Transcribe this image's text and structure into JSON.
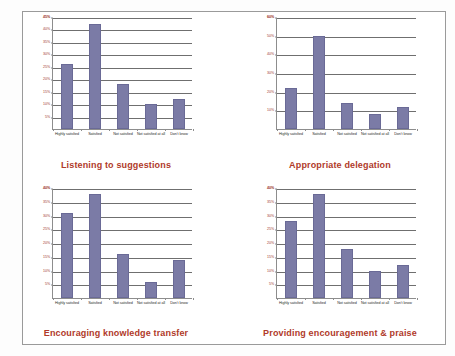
{
  "document": {
    "background_color": "#fdfdfd",
    "frame_color": "#9a9a9a",
    "bar_color": "#7b7ba6",
    "title_color": "#b03a2a",
    "tick_label_color": "#a0392c",
    "axis_color": "#8d8d8d"
  },
  "categories": [
    "Highly satisfied",
    "Satisfied",
    "Not satisfied",
    "Not satisfied at all",
    "Don't know"
  ],
  "chart_data": [
    {
      "type": "bar",
      "title": "Listening to suggestions",
      "categories": [
        "Highly satisfied",
        "Satisfied",
        "Not satisfied",
        "Not satisfied at all",
        "Don't know"
      ],
      "values": [
        26,
        42,
        18,
        10,
        12
      ],
      "tick_labels": [
        "5%",
        "10%",
        "15%",
        "20%",
        "25%",
        "30%",
        "35%",
        "40%",
        "45%"
      ],
      "ticks": [
        5,
        10,
        15,
        20,
        25,
        30,
        35,
        40,
        45
      ],
      "ylim": [
        0,
        45
      ],
      "xlabel": "",
      "ylabel": "",
      "grid": true,
      "legend": "none"
    },
    {
      "type": "bar",
      "title": "Appropriate delegation",
      "categories": [
        "Highly satisfied",
        "Satisfied",
        "Not satisfied",
        "Not satisfied at all",
        "Don't know"
      ],
      "values": [
        22,
        50,
        14,
        8,
        12
      ],
      "tick_labels": [
        "10%",
        "20%",
        "30%",
        "40%",
        "50%",
        "60%"
      ],
      "ticks": [
        10,
        20,
        30,
        40,
        50,
        60
      ],
      "ylim": [
        0,
        60
      ],
      "xlabel": "",
      "ylabel": "",
      "grid": true,
      "legend": "none"
    },
    {
      "type": "bar",
      "title": "Encouraging knowledge transfer",
      "categories": [
        "Highly satisfied",
        "Satisfied",
        "Not satisfied",
        "Not satisfied at all",
        "Don't know"
      ],
      "values": [
        31,
        38,
        16,
        6,
        14
      ],
      "tick_labels": [
        "5%",
        "10%",
        "15%",
        "20%",
        "25%",
        "30%",
        "35%",
        "40%"
      ],
      "ticks": [
        5,
        10,
        15,
        20,
        25,
        30,
        35,
        40
      ],
      "ylim": [
        0,
        40
      ],
      "xlabel": "",
      "ylabel": "",
      "grid": true,
      "legend": "none"
    },
    {
      "type": "bar",
      "title": "Providing encouragement & praise",
      "categories": [
        "Highly satisfied",
        "Satisfied",
        "Not satisfied",
        "Not satisfied at all",
        "Don't know"
      ],
      "values": [
        28,
        38,
        18,
        10,
        12
      ],
      "tick_labels": [
        "5%",
        "10%",
        "15%",
        "20%",
        "25%",
        "30%",
        "35%",
        "40%"
      ],
      "ticks": [
        5,
        10,
        15,
        20,
        25,
        30,
        35,
        40
      ],
      "ylim": [
        0,
        40
      ],
      "xlabel": "",
      "ylabel": "",
      "grid": true,
      "legend": "none"
    }
  ]
}
